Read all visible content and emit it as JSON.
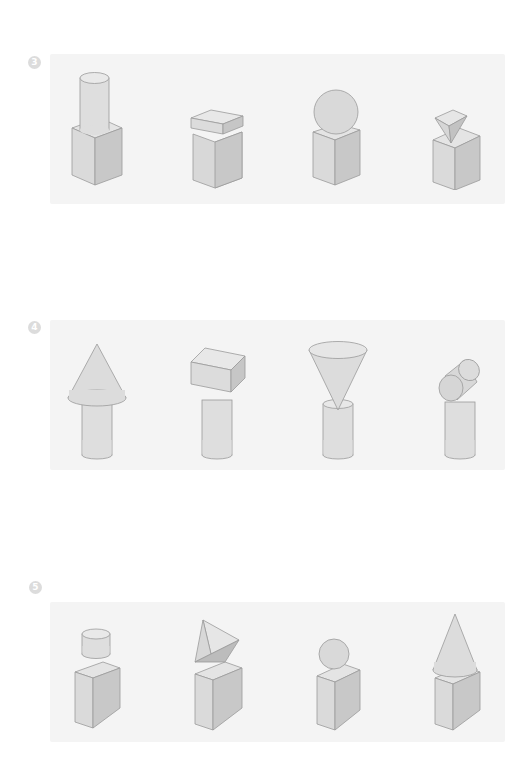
{
  "rows": [
    {
      "number": "3",
      "figures": [
        {
          "name": "cylinder-on-cube",
          "top": "cylinder",
          "base": "cube"
        },
        {
          "name": "box-on-cube",
          "top": "rectangular-prism",
          "base": "cube"
        },
        {
          "name": "sphere-on-cube",
          "top": "sphere",
          "base": "cube"
        },
        {
          "name": "pyramid-on-cube",
          "top": "inverted-triangular-pyramid",
          "base": "cube"
        }
      ]
    },
    {
      "number": "4",
      "figures": [
        {
          "name": "cone-on-cylinder",
          "top": "cone",
          "base": "cylinder"
        },
        {
          "name": "box-on-cylinder",
          "top": "rectangular-prism",
          "base": "cylinder"
        },
        {
          "name": "inverted-cone-on-cylinder",
          "top": "inverted-cone",
          "base": "cylinder"
        },
        {
          "name": "sideways-cylinder-on-cylinder",
          "top": "horizontal-cylinder",
          "base": "cylinder"
        }
      ]
    },
    {
      "number": "5",
      "figures": [
        {
          "name": "short-cylinder-on-box",
          "top": "short-cylinder",
          "base": "rectangular-prism"
        },
        {
          "name": "triangular-prism-on-box",
          "top": "triangular-prism",
          "base": "rectangular-prism"
        },
        {
          "name": "sphere-on-box",
          "top": "sphere",
          "base": "rectangular-prism"
        },
        {
          "name": "cone-on-box",
          "top": "cone",
          "base": "rectangular-prism"
        }
      ]
    }
  ],
  "colors": {
    "panel": "#f4f4f4",
    "face_light": "#e6e6e6",
    "face_mid": "#d6d6d6",
    "face_dark": "#c4c4c4",
    "stroke": "#9a9a9a",
    "badge": "#dcdcdc"
  }
}
